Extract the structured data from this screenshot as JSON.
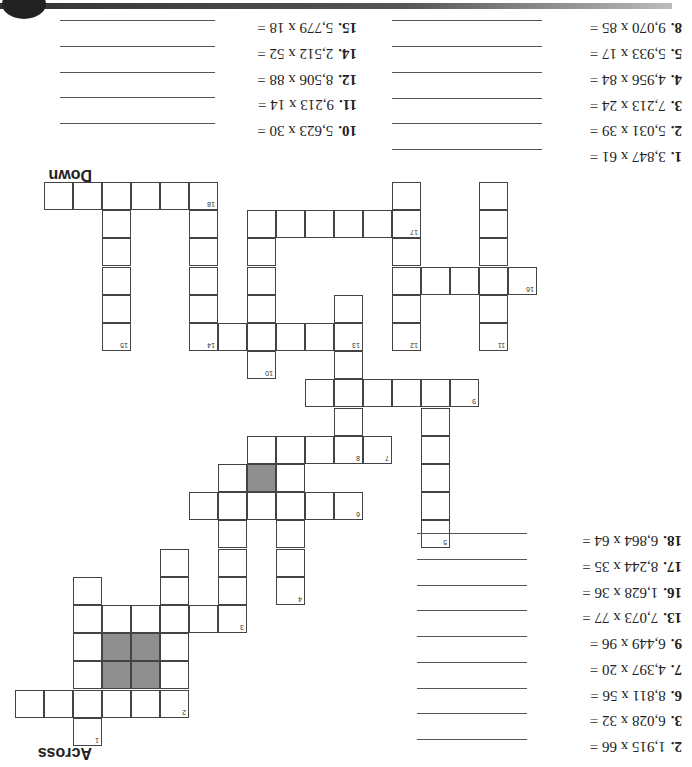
{
  "orientation": "rotated-180",
  "headings": {
    "across": "Across",
    "down": "Down"
  },
  "across": [
    {
      "num": "2.",
      "expr": "1,915 x 66 ="
    },
    {
      "num": "3.",
      "expr": "6,028 x 32 ="
    },
    {
      "num": "6.",
      "expr": "8,811 x 56 ="
    },
    {
      "num": "7.",
      "expr": "4,397 x 20 ="
    },
    {
      "num": "9.",
      "expr": "6,449 x 96 ="
    },
    {
      "num": "13.",
      "expr": "7,073 x 77 ="
    },
    {
      "num": "16.",
      "expr": "1,628 x 36 ="
    },
    {
      "num": "17.",
      "expr": "8,244 x 35 ="
    },
    {
      "num": "18.",
      "expr": "6,864 x 64 ="
    }
  ],
  "down_col1": [
    {
      "num": "1.",
      "expr": "3,847 x 61 ="
    },
    {
      "num": "2.",
      "expr": "5,031 x 39 ="
    },
    {
      "num": "3.",
      "expr": "7,213 x 24 ="
    },
    {
      "num": "4.",
      "expr": "4,956 x 84 ="
    },
    {
      "num": "5.",
      "expr": "5,933 x 17 ="
    },
    {
      "num": "8.",
      "expr": "9,070 x 85 ="
    }
  ],
  "down_col2": [
    {
      "num": "10.",
      "expr": "5,623 x 30 ="
    },
    {
      "num": "11.",
      "expr": "9,213 x 14 ="
    },
    {
      "num": "12.",
      "expr": "8,506 x 88 ="
    },
    {
      "num": "14.",
      "expr": "2,512 x 52 ="
    },
    {
      "num": "15.",
      "expr": "5,779 x 18 ="
    }
  ],
  "cells": [
    [
      0,
      1
    ],
    [
      0,
      2
    ],
    [
      0,
      3
    ],
    [
      0,
      4
    ],
    [
      0,
      5
    ],
    [
      0,
      6,
      "18"
    ],
    [
      0,
      13
    ],
    [
      0,
      16
    ],
    [
      1,
      3
    ],
    [
      1,
      6
    ],
    [
      1,
      8
    ],
    [
      1,
      9
    ],
    [
      1,
      10
    ],
    [
      1,
      11
    ],
    [
      1,
      12
    ],
    [
      1,
      13,
      "17"
    ],
    [
      1,
      16
    ],
    [
      2,
      3
    ],
    [
      2,
      6
    ],
    [
      2,
      8
    ],
    [
      2,
      13
    ],
    [
      2,
      16
    ],
    [
      3,
      3
    ],
    [
      3,
      6
    ],
    [
      3,
      8
    ],
    [
      3,
      13
    ],
    [
      3,
      14
    ],
    [
      3,
      15
    ],
    [
      3,
      16
    ],
    [
      3,
      17,
      "16"
    ],
    [
      4,
      3
    ],
    [
      4,
      6
    ],
    [
      4,
      8
    ],
    [
      4,
      11
    ],
    [
      4,
      13
    ],
    [
      4,
      16
    ],
    [
      5,
      3,
      "15"
    ],
    [
      5,
      6,
      "14"
    ],
    [
      5,
      7
    ],
    [
      5,
      8
    ],
    [
      5,
      9
    ],
    [
      5,
      10
    ],
    [
      5,
      11,
      "13"
    ],
    [
      5,
      13,
      "12"
    ],
    [
      5,
      16,
      "11"
    ],
    [
      6,
      8,
      "10"
    ],
    [
      6,
      11
    ],
    [
      7,
      10
    ],
    [
      7,
      11
    ],
    [
      7,
      12
    ],
    [
      7,
      13
    ],
    [
      7,
      14
    ],
    [
      7,
      15,
      "9"
    ],
    [
      8,
      11
    ],
    [
      8,
      14
    ],
    [
      9,
      8
    ],
    [
      9,
      9
    ],
    [
      9,
      10
    ],
    [
      9,
      11,
      "8"
    ],
    [
      9,
      12,
      "7"
    ],
    [
      9,
      14
    ],
    [
      10,
      7
    ],
    [
      10,
      8,
      "S"
    ],
    [
      10,
      9
    ],
    [
      10,
      14
    ],
    [
      11,
      6
    ],
    [
      11,
      7
    ],
    [
      11,
      8
    ],
    [
      11,
      9
    ],
    [
      11,
      10
    ],
    [
      11,
      11,
      "6"
    ],
    [
      11,
      14
    ],
    [
      12,
      7
    ],
    [
      12,
      9
    ],
    [
      12,
      14,
      "5"
    ],
    [
      13,
      5
    ],
    [
      13,
      7
    ],
    [
      13,
      9
    ],
    [
      14,
      2
    ],
    [
      14,
      5
    ],
    [
      14,
      7
    ],
    [
      14,
      9,
      "4"
    ],
    [
      15,
      2
    ],
    [
      15,
      3
    ],
    [
      15,
      4
    ],
    [
      15,
      5
    ],
    [
      15,
      6
    ],
    [
      15,
      7,
      "3"
    ],
    [
      16,
      2
    ],
    [
      16,
      3,
      "S"
    ],
    [
      16,
      4,
      "S"
    ],
    [
      16,
      5
    ],
    [
      17,
      2
    ],
    [
      17,
      3,
      "S"
    ],
    [
      17,
      4,
      "S"
    ],
    [
      17,
      5
    ],
    [
      18,
      0
    ],
    [
      18,
      1
    ],
    [
      18,
      2
    ],
    [
      18,
      3
    ],
    [
      18,
      4
    ],
    [
      18,
      5,
      "2"
    ],
    [
      19,
      2,
      "1"
    ]
  ]
}
